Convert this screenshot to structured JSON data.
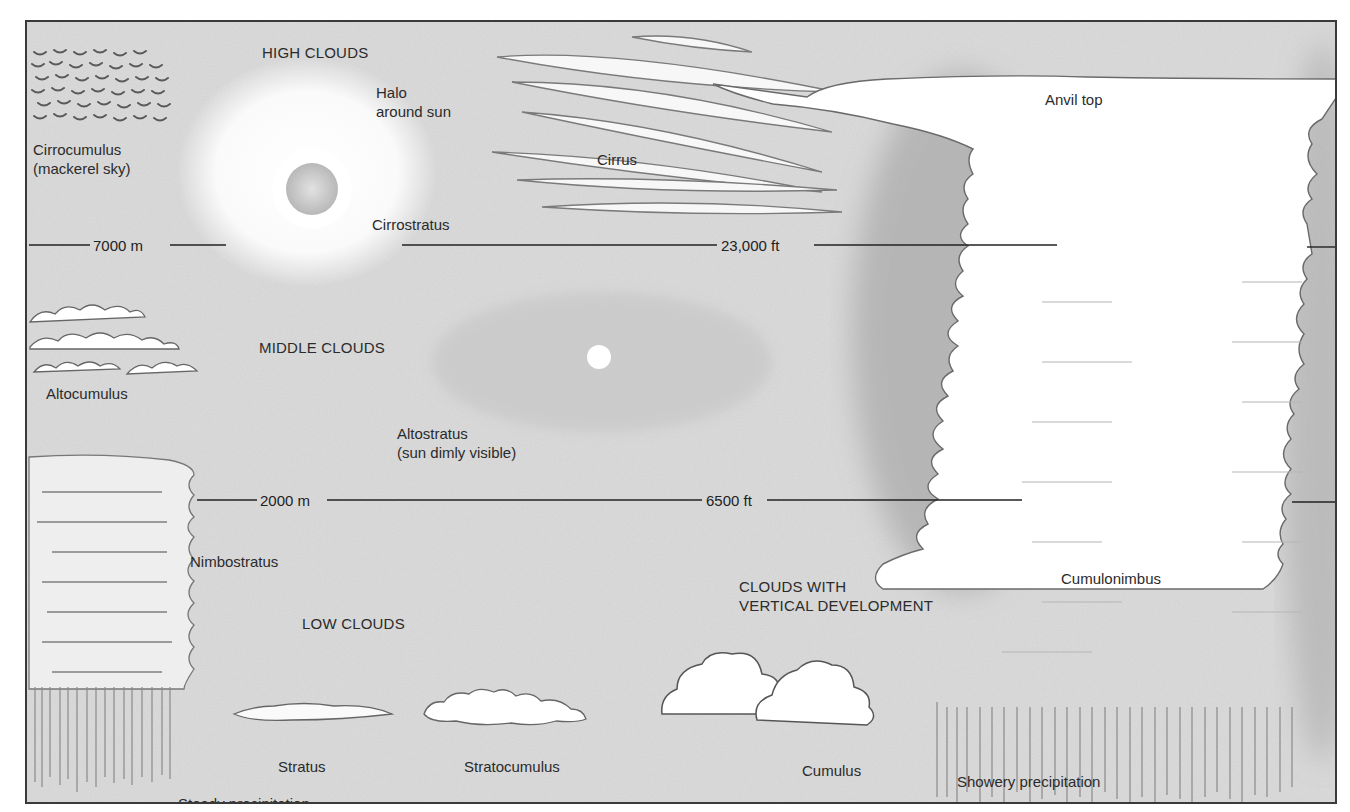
{
  "diagram": {
    "categories": {
      "high": "HIGH CLOUDS",
      "middle": "MIDDLE CLOUDS",
      "low": "LOW CLOUDS",
      "vertical_line1": "CLOUDS WITH",
      "vertical_line2": "VERTICAL DEVELOPMENT"
    },
    "altitude_lines": {
      "high_metric": "7000 m",
      "high_imperial": "23,000 ft",
      "low_metric": "2000 m",
      "low_imperial": "6500 ft"
    },
    "clouds": {
      "cirrocumulus": "Cirrocumulus",
      "cirrocumulus_note": "(mackerel sky)",
      "halo_line1": "Halo",
      "halo_line2": "around sun",
      "cirrostratus": "Cirrostratus",
      "cirrus": "Cirrus",
      "anvil_top": "Anvil top",
      "altocumulus": "Altocumulus",
      "altostratus": "Altostratus",
      "altostratus_note": "(sun dimly visible)",
      "nimbostratus": "Nimbostratus",
      "cumulonimbus": "Cumulonimbus",
      "stratus": "Stratus",
      "stratocumulus": "Stratocumulus",
      "cumulus": "Cumulus"
    },
    "precipitation": {
      "steady": "Steady precipitation",
      "showery": "Showery precipitation"
    },
    "colors": {
      "sky": "#d6d6d6",
      "cloud": "#ffffff",
      "line": "#2a2a2a",
      "shade": "#9a9a9a"
    }
  }
}
